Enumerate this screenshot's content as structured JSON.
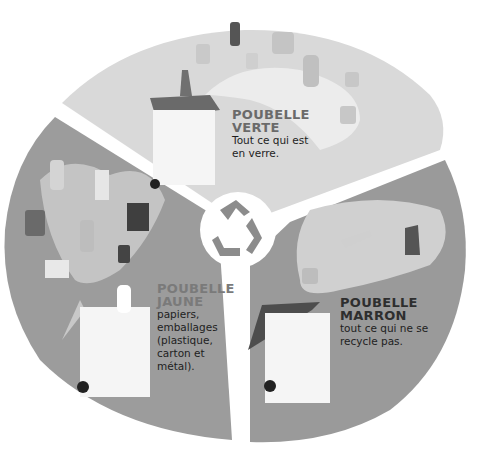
{
  "infographic": {
    "center_icon": "recycle-icon",
    "colors": {
      "verte_sector": "#d9d9d9",
      "jaune_sector": "#9c9c9c",
      "marron_sector": "#9a9a9a",
      "verte_path": "#ececec",
      "jaune_path": "#c4c4c4",
      "marron_path": "#d0d0d0",
      "divider": "#ffffff"
    },
    "sections": [
      {
        "id": "verte",
        "title_line1": "POUBELLE",
        "title_line2": "VERTE",
        "description_lines": [
          "Tout ce qui est",
          "en verre."
        ],
        "items": [
          "bottle",
          "jar",
          "jar",
          "glass",
          "bottle",
          "jar",
          "jar",
          "jar"
        ]
      },
      {
        "id": "jaune",
        "title_line1": "POUBELLE",
        "title_line2": "JAUNE",
        "description_lines": [
          "papiers,",
          "emballages",
          "(plastique,",
          "carton et",
          "métal)."
        ],
        "items": [
          "plastic-bottle",
          "milk-carton",
          "tin-can",
          "cereal-box",
          "plastic-bottle",
          "soda-can",
          "newspaper",
          "milk-bottle"
        ],
        "item_labels": {
          "milk_bottle": "LAIT"
        }
      },
      {
        "id": "marron",
        "title_line1": "POUBELLE",
        "title_line2": "MARRON",
        "description_lines": [
          "tout ce qui ne se",
          "recycle pas."
        ],
        "items": [
          "food-scraps",
          "fish-bone",
          "boot",
          "apple-core",
          "yogurt-pot",
          "broken-toy"
        ]
      }
    ]
  }
}
